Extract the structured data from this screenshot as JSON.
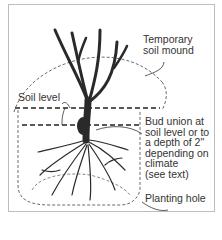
{
  "labels": {
    "mound": [
      "Temporary",
      "soil mound"
    ],
    "soil_level": "Soil level",
    "bud_union": [
      "Bud union at",
      "soil level or to",
      "a depth of 2\"",
      "depending on",
      "climate",
      "(see text)"
    ],
    "planting_hole": "Planting hole"
  },
  "colors": {
    "ink": "#2a2a2a",
    "text": "#333333",
    "frame": "#bdbdbd"
  }
}
